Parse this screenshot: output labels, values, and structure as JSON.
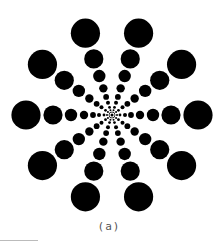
{
  "figure": {
    "center": [
      112,
      115
    ],
    "spoke_count": 10,
    "start_angle_deg": 0,
    "dot_color": "#000000",
    "background": "#ffffff",
    "dots_per_spoke": [
      {
        "distance": 5,
        "radius": 1.0
      },
      {
        "distance": 8,
        "radius": 1.4
      },
      {
        "distance": 13,
        "radius": 2.0
      },
      {
        "distance": 19,
        "radius": 2.9
      },
      {
        "distance": 28,
        "radius": 4.2
      },
      {
        "distance": 41,
        "radius": 6.2
      },
      {
        "distance": 59,
        "radius": 9.6
      },
      {
        "distance": 86,
        "radius": 14.6
      }
    ],
    "center_dot_radius": 1.5,
    "center_ring_radius": 3
  },
  "caption": {
    "label": "(a)"
  }
}
